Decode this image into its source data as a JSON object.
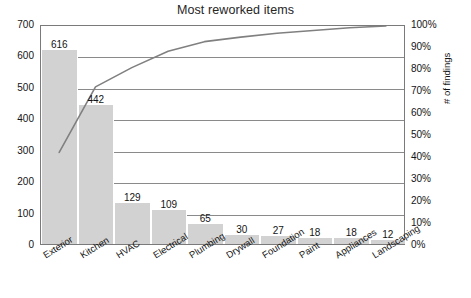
{
  "chart_data": {
    "type": "bar",
    "title": "Most reworked items",
    "xlabel": "",
    "ylabel": "",
    "y2label": "# of findings",
    "grid": true,
    "legend": false,
    "categories": [
      "Exterior",
      "Kitchen",
      "HVAC",
      "Electrical",
      "Plumbing",
      "Drywall",
      "Foundation",
      "Paint",
      "Appliances",
      "Landscaping"
    ],
    "series": [
      {
        "name": "count",
        "type": "bar",
        "axis": "left",
        "values": [
          616,
          442,
          129,
          109,
          65,
          30,
          27,
          18,
          18,
          12
        ],
        "color": "#d2d2d2"
      },
      {
        "name": "cumulative percent",
        "type": "line",
        "axis": "right",
        "values": [
          42.0,
          72.1,
          80.9,
          88.4,
          92.8,
          94.9,
          96.7,
          97.9,
          99.2,
          100.0
        ],
        "color": "#808080"
      }
    ],
    "ylim": [
      0,
      700
    ],
    "yticks": [
      0,
      100,
      200,
      300,
      400,
      500,
      600,
      700
    ],
    "ytick_labels": [
      "0",
      "100",
      "200",
      "300",
      "400",
      "500",
      "600",
      "700"
    ],
    "y2lim": [
      0,
      100
    ],
    "y2ticks": [
      0,
      10,
      20,
      30,
      40,
      50,
      60,
      70,
      80,
      90,
      100
    ],
    "y2tick_labels": [
      "0%",
      "10%",
      "20%",
      "30%",
      "40%",
      "50%",
      "60%",
      "70%",
      "80%",
      "90%",
      "100%"
    ],
    "bar_labels": [
      "616",
      "442",
      "129",
      "109",
      "65",
      "30",
      "27",
      "18",
      "18",
      "12"
    ]
  }
}
